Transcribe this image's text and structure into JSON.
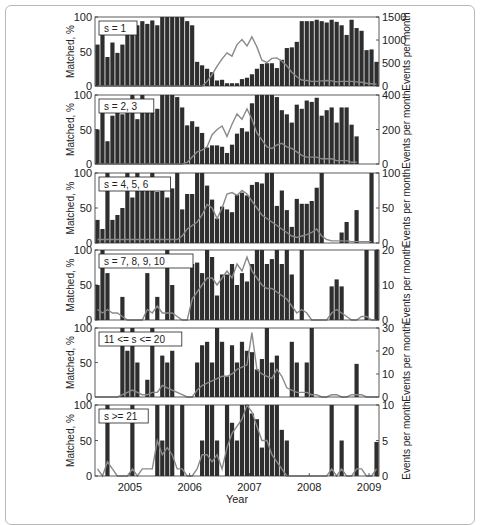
{
  "chart_data": {
    "type": "bar",
    "xlabel": "Year",
    "x_ticks": [
      "2005",
      "2006",
      "2007",
      "2008",
      "2009"
    ],
    "months_start": "2004-06",
    "n_months": 57,
    "colors": {
      "bar": "#2e2e2e",
      "bar_gap": "#ffffff",
      "line": "#8a8a8a",
      "axis": "#333333",
      "frame": "#b8b8b8"
    },
    "panels": [
      {
        "label": "s = 1",
        "ylabel_left": "Matched, %",
        "ylabel_right": "Events per month",
        "ylim_left": [
          0,
          100
        ],
        "left_ticks": [
          "0",
          "50",
          "100"
        ],
        "ylim_right": [
          0,
          1500
        ],
        "right_ticks": [
          "0",
          "500",
          "1000",
          "1500"
        ],
        "matched": [
          60,
          80,
          42,
          63,
          48,
          60,
          85,
          94,
          88,
          94,
          90,
          95,
          88,
          100,
          100,
          100,
          100,
          100,
          94,
          88,
          35,
          30,
          25,
          20,
          8,
          9,
          4,
          4,
          4,
          10,
          12,
          17,
          25,
          32,
          33,
          33,
          26,
          38,
          55,
          56,
          64,
          94,
          94,
          94,
          96,
          94,
          92,
          96,
          93,
          88,
          74,
          96,
          84,
          80,
          52,
          53,
          35
        ],
        "events": [
          0,
          0,
          0,
          0,
          0,
          0,
          0,
          0,
          0,
          0,
          0,
          0,
          0,
          0,
          0,
          0,
          0,
          0,
          0,
          0,
          0,
          0,
          100,
          250,
          430,
          590,
          720,
          650,
          900,
          1010,
          870,
          1070,
          850,
          560,
          510,
          600,
          610,
          540,
          440,
          300,
          200,
          130,
          120,
          100,
          100,
          110,
          120,
          110,
          90,
          100,
          100,
          100,
          90,
          80,
          60,
          50,
          40
        ]
      },
      {
        "label": "s = 2, 3",
        "ylabel_left": "Matched, %",
        "ylabel_right": "Events per month",
        "ylim_left": [
          0,
          100
        ],
        "left_ticks": [
          "0",
          "50",
          "100"
        ],
        "ylim_right": [
          0,
          400
        ],
        "right_ticks": [
          "0",
          "200",
          "400"
        ],
        "matched": [
          50,
          85,
          33,
          70,
          80,
          72,
          90,
          100,
          65,
          100,
          86,
          75,
          80,
          100,
          100,
          100,
          97,
          82,
          56,
          62,
          54,
          45,
          24,
          27,
          27,
          25,
          16,
          28,
          44,
          52,
          47,
          88,
          100,
          100,
          100,
          100,
          97,
          78,
          72,
          60,
          86,
          80,
          92,
          90,
          96,
          70,
          78,
          82,
          60,
          82,
          82,
          57,
          40
        ],
        "events": [
          0,
          0,
          0,
          0,
          0,
          0,
          0,
          0,
          0,
          0,
          0,
          0,
          0,
          0,
          0,
          0,
          0,
          0,
          10,
          40,
          70,
          80,
          100,
          170,
          200,
          220,
          160,
          230,
          290,
          260,
          320,
          260,
          180,
          140,
          100,
          90,
          110,
          120,
          100,
          90,
          70,
          50,
          40,
          40,
          40,
          30,
          30,
          30,
          20,
          20,
          20,
          10,
          10
        ]
      },
      {
        "label": "s = 4, 5, 6",
        "ylabel_left": "Matched, %",
        "ylabel_right": "Events per month",
        "ylim_left": [
          0,
          100
        ],
        "left_ticks": [
          "0",
          "50",
          "100"
        ],
        "ylim_right": [
          0,
          100
        ],
        "right_ticks": [
          "0",
          "50",
          "100"
        ],
        "matched": [
          33,
          20,
          100,
          33,
          40,
          50,
          100,
          65,
          100,
          78,
          80,
          100,
          73,
          83,
          65,
          78,
          100,
          48,
          70,
          70,
          100,
          100,
          82,
          62,
          35,
          52,
          48,
          44,
          69,
          72,
          68,
          83,
          87,
          85,
          100,
          100,
          53,
          75,
          47,
          23,
          63,
          56,
          56,
          60,
          79,
          100,
          0,
          0,
          0,
          15,
          30,
          0,
          47,
          0,
          0,
          100
        ],
        "events": [
          5,
          5,
          5,
          5,
          5,
          5,
          5,
          5,
          5,
          5,
          5,
          5,
          5,
          5,
          5,
          5,
          5,
          10,
          20,
          25,
          30,
          40,
          55,
          50,
          35,
          50,
          70,
          72,
          68,
          75,
          70,
          60,
          50,
          40,
          35,
          30,
          25,
          20,
          15,
          10,
          8,
          10,
          12,
          15,
          20,
          10,
          5,
          3,
          3,
          3,
          3,
          2,
          2,
          2,
          2,
          2
        ]
      },
      {
        "label": "s = 7, 8, 9, 10",
        "ylabel_left": "Matched, %",
        "ylabel_right": "Events per month",
        "ylim_left": [
          0,
          100
        ],
        "left_ticks": [
          "0",
          "50",
          "100"
        ],
        "ylim_right": [
          0,
          20
        ],
        "right_ticks": [
          "0",
          "10",
          "20"
        ],
        "matched": [
          50,
          100,
          67,
          0,
          0,
          33,
          0,
          0,
          0,
          0,
          67,
          0,
          33,
          0,
          100,
          50,
          0,
          0,
          0,
          80,
          82,
          67,
          100,
          90,
          35,
          65,
          65,
          80,
          50,
          67,
          55,
          80,
          100,
          100,
          80,
          87,
          100,
          80,
          100,
          65,
          0,
          100,
          0,
          0,
          0,
          0,
          0,
          48,
          58,
          48,
          0,
          0,
          0,
          0,
          100,
          0,
          100
        ],
        "events": [
          3,
          2,
          3,
          2,
          2,
          1,
          0,
          0,
          0,
          0,
          3,
          2,
          4,
          2,
          2,
          2,
          1,
          0,
          0,
          6,
          8,
          10,
          12,
          12,
          10,
          12,
          14,
          12,
          16,
          14,
          18,
          14,
          12,
          10,
          9,
          9,
          8,
          7,
          6,
          4,
          2,
          3,
          2,
          0,
          0,
          0,
          0,
          2,
          3,
          2,
          1,
          0,
          0,
          1,
          1,
          0,
          0
        ]
      },
      {
        "label": "11 <= s <= 20",
        "ylabel_left": "Matched, %",
        "ylabel_right": "Events per month",
        "ylim_left": [
          0,
          100
        ],
        "left_ticks": [
          "0",
          "50",
          "100"
        ],
        "ylim_right": [
          0,
          30
        ],
        "right_ticks": [
          "0",
          "10",
          "20",
          "30"
        ],
        "matched": [
          0,
          0,
          0,
          0,
          0,
          100,
          67,
          100,
          50,
          0,
          25,
          100,
          0,
          60,
          50,
          67,
          0,
          0,
          0,
          0,
          50,
          75,
          80,
          50,
          100,
          80,
          30,
          75,
          50,
          80,
          67,
          65,
          40,
          55,
          100,
          50,
          60,
          0,
          0,
          80,
          50,
          0,
          50,
          100,
          0,
          0,
          0,
          0,
          0,
          0,
          0,
          0,
          48,
          0,
          0,
          0,
          0
        ],
        "events": [
          0,
          0,
          0,
          0,
          0,
          1,
          2,
          3,
          2,
          1,
          1,
          2,
          2,
          5,
          4,
          3,
          2,
          1,
          0,
          0,
          3,
          5,
          6,
          7,
          8,
          9,
          9,
          10,
          12,
          13,
          14,
          28,
          12,
          10,
          9,
          8,
          12,
          9,
          4,
          3,
          2,
          2,
          2,
          1,
          1,
          0,
          0,
          1,
          1,
          0,
          0,
          1,
          1,
          1,
          0,
          0,
          0
        ]
      },
      {
        "label": "s >= 21",
        "ylabel_left": "Matched, %",
        "ylabel_right": "Events per month",
        "ylim_left": [
          0,
          100
        ],
        "left_ticks": [
          "0",
          "50",
          "100"
        ],
        "ylim_right": [
          0,
          10
        ],
        "right_ticks": [
          "0",
          "5",
          "10"
        ],
        "matched": [
          0,
          0,
          100,
          0,
          0,
          0,
          0,
          100,
          0,
          0,
          0,
          0,
          100,
          50,
          100,
          100,
          0,
          100,
          0,
          0,
          0,
          50,
          100,
          100,
          50,
          0,
          100,
          75,
          50,
          100,
          100,
          88,
          80,
          40,
          100,
          100,
          100,
          65,
          50,
          0,
          0,
          0,
          0,
          0,
          0,
          0,
          0,
          100,
          0,
          50,
          0,
          0,
          100,
          0,
          0,
          0,
          48
        ],
        "events": [
          1,
          0,
          2,
          1,
          0,
          0,
          0,
          1,
          0,
          1,
          1,
          1,
          5,
          3,
          4,
          3,
          1,
          1,
          0,
          0,
          1,
          3,
          3,
          2,
          3,
          1,
          4,
          6,
          7,
          8,
          10,
          9,
          7,
          5,
          5,
          3,
          2,
          1,
          0,
          0,
          0,
          0,
          0,
          0,
          0,
          0,
          0,
          1,
          0,
          1,
          0,
          0,
          1,
          1,
          0,
          0,
          1
        ]
      }
    ]
  }
}
